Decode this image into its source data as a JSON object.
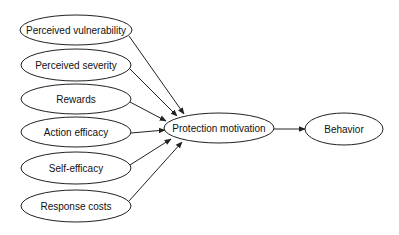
{
  "diagram": {
    "type": "path-model",
    "nodes": [
      {
        "id": "perceived_vulnerability",
        "label": "Perceived vulnerability",
        "cx": 76,
        "cy": 30,
        "rx": 56,
        "ry": 15
      },
      {
        "id": "perceived_severity",
        "label": "Perceived severity",
        "cx": 76,
        "cy": 65,
        "rx": 55,
        "ry": 16
      },
      {
        "id": "rewards",
        "label": "Rewards",
        "cx": 76,
        "cy": 99,
        "rx": 55,
        "ry": 15
      },
      {
        "id": "action_efficacy",
        "label": "Action efficacy",
        "cx": 76,
        "cy": 132,
        "rx": 55,
        "ry": 15
      },
      {
        "id": "self_efficacy",
        "label": "Self-efficacy",
        "cx": 76,
        "cy": 168,
        "rx": 55,
        "ry": 16
      },
      {
        "id": "response_costs",
        "label": "Response costs",
        "cx": 76,
        "cy": 206,
        "rx": 55,
        "ry": 16
      },
      {
        "id": "protection_motivation",
        "label": "Protection motivation",
        "cx": 219,
        "cy": 128,
        "rx": 55,
        "ry": 15
      },
      {
        "id": "behavior",
        "label": "Behavior",
        "cx": 344,
        "cy": 129,
        "rx": 39,
        "ry": 16
      }
    ],
    "edges": [
      {
        "from": "perceived_vulnerability",
        "to": "protection_motivation",
        "x1": 129,
        "y1": 36,
        "x2": 184,
        "y2": 114
      },
      {
        "from": "perceived_severity",
        "to": "protection_motivation",
        "x1": 130,
        "y1": 69,
        "x2": 177,
        "y2": 116
      },
      {
        "from": "rewards",
        "to": "protection_motivation",
        "x1": 130,
        "y1": 102,
        "x2": 166,
        "y2": 121
      },
      {
        "from": "action_efficacy",
        "to": "protection_motivation",
        "x1": 131,
        "y1": 133,
        "x2": 165,
        "y2": 130
      },
      {
        "from": "self_efficacy",
        "to": "protection_motivation",
        "x1": 130,
        "y1": 165,
        "x2": 171,
        "y2": 139
      },
      {
        "from": "response_costs",
        "to": "protection_motivation",
        "x1": 129,
        "y1": 201,
        "x2": 182,
        "y2": 142
      },
      {
        "from": "protection_motivation",
        "to": "behavior",
        "x1": 274,
        "y1": 129,
        "x2": 305,
        "y2": 129
      }
    ],
    "colors": {
      "stroke": "#222222",
      "fill": "#ffffff",
      "text": "#111111",
      "background": "#ffffff"
    }
  }
}
